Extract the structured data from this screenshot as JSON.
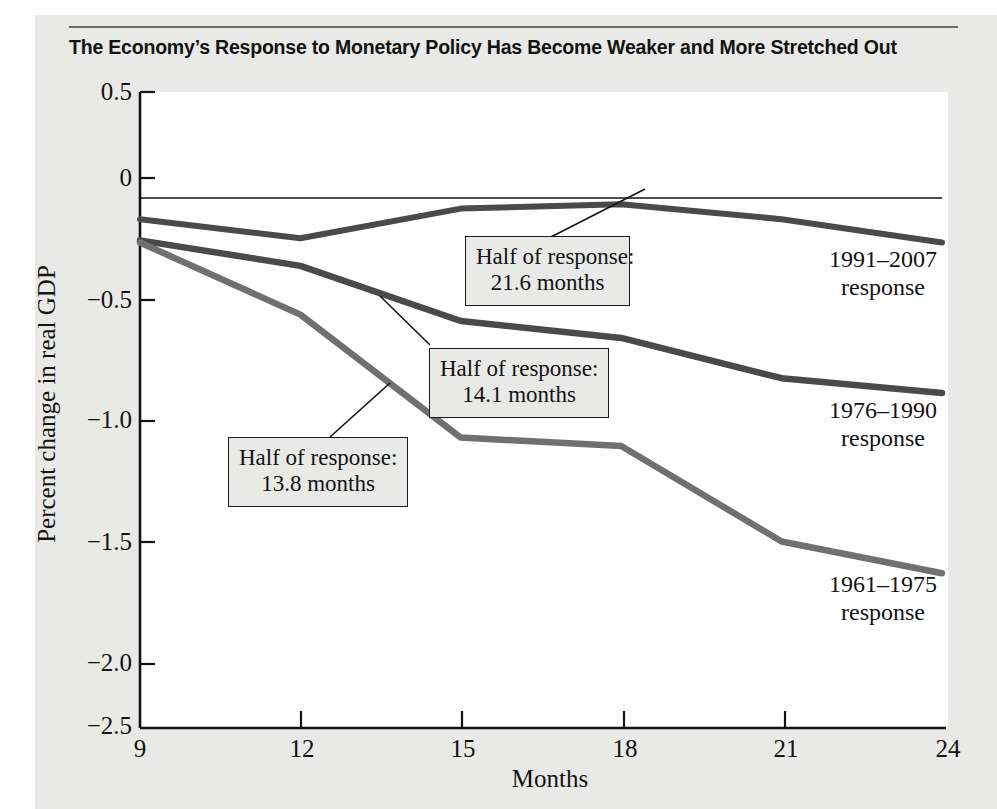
{
  "figure": {
    "title": "The Economy’s Response to Monetary Policy Has Become Weaker and More Stretched Out",
    "background_color": "#e9e9e7",
    "plot_background_color": "#ffffff",
    "line_color": "#4a4a4a",
    "axis_color": "#131313"
  },
  "chart_data": {
    "type": "line",
    "title": "The Economy’s Response to Monetary Policy Has Become Weaker and More Stretched Out",
    "xlabel": "Months",
    "ylabel": "Percent change in real GDP",
    "x": [
      9,
      12,
      15,
      18,
      21,
      24
    ],
    "xlim": [
      9,
      24
    ],
    "ylim": [
      -2.5,
      0.5
    ],
    "xticks": [
      "9",
      "12",
      "15",
      "18",
      "21",
      "24"
    ],
    "yticks": [
      "0.5",
      "0",
      "−0.5",
      "−1.0",
      "−1.5",
      "−2.0",
      "−2.5"
    ],
    "ytick_values": [
      0.5,
      0,
      -0.5,
      -1.0,
      -1.5,
      -2.0,
      -2.5
    ],
    "grid": false,
    "legend": "inline-right-labels",
    "series": [
      {
        "name": "1991–2007 response",
        "values": [
          -0.1,
          -0.19,
          -0.05,
          -0.03,
          -0.1,
          -0.21
        ]
      },
      {
        "name": "1976–1990 response",
        "values": [
          -0.2,
          -0.32,
          -0.58,
          -0.66,
          -0.85,
          -0.92
        ]
      },
      {
        "name": "1961–1975 response",
        "values": [
          -0.21,
          -0.55,
          -1.13,
          -1.17,
          -1.62,
          -1.77
        ]
      }
    ],
    "annotations": [
      {
        "id": "half-response-1991-2007",
        "line1": "Half of response:",
        "line2": "21.6 months",
        "points_to_series": "1991–2007 response",
        "months": 21.6
      },
      {
        "id": "half-response-1976-1990",
        "line1": "Half of response:",
        "line2": "14.1 months",
        "points_to_series": "1976–1990 response",
        "months": 14.1
      },
      {
        "id": "half-response-1961-1975",
        "line1": "Half of response:",
        "line2": "13.8 months",
        "points_to_series": "1961–1975 response",
        "months": 13.8
      }
    ]
  },
  "axis": {
    "y_ticks": [
      {
        "label": "0.5"
      },
      {
        "label": "0"
      },
      {
        "label": "−0.5"
      },
      {
        "label": "−1.0"
      },
      {
        "label": "−1.5"
      },
      {
        "label": "−2.0"
      },
      {
        "label": "−2.5"
      }
    ],
    "x_ticks": [
      {
        "label": "9"
      },
      {
        "label": "12"
      },
      {
        "label": "15"
      },
      {
        "label": "18"
      },
      {
        "label": "21"
      },
      {
        "label": "24"
      }
    ],
    "y_axis_title": "Percent change in real GDP",
    "x_axis_title": "Months"
  },
  "series_labels": [
    {
      "line1": "1991–2007",
      "line2": "response"
    },
    {
      "line1": "1976–1990",
      "line2": "response"
    },
    {
      "line1": "1961–1975",
      "line2": "response"
    }
  ],
  "callouts": [
    {
      "line1": "Half of response:",
      "line2": "21.6 months"
    },
    {
      "line1": "Half of response:",
      "line2": "14.1 months"
    },
    {
      "line1": "Half of response:",
      "line2": "13.8 months"
    }
  ]
}
